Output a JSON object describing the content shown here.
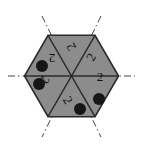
{
  "figure": {
    "canvas": {
      "width": 143,
      "height": 154
    },
    "background_color": "#ffffff"
  },
  "chart_data": {
    "type": "diagram",
    "shape": "regular-hexagon",
    "center": {
      "x": 71.5,
      "y": 76
    },
    "circumradius": 47,
    "orientation": "flat-left-right-vertices",
    "fill_color": "#8c8c8c",
    "stroke_color": "#2b2b2b",
    "sector_count": 6,
    "sectors": [
      {
        "index": 0,
        "name": "right",
        "label": "2",
        "label_rotation_deg": 0,
        "label_x": 100,
        "label_y": 76,
        "has_dot": false
      },
      {
        "index": 1,
        "name": "upper-right",
        "label": "2",
        "label_rotation_deg": 300,
        "label_x": 91,
        "label_y": 57,
        "has_dot": false
      },
      {
        "index": 2,
        "name": "upper-left",
        "label": "2",
        "label_rotation_deg": 240,
        "label_x": 71,
        "label_y": 47,
        "has_dot": false
      },
      {
        "index": 3,
        "name": "left",
        "label": "2",
        "label_rotation_deg": 180,
        "label_x": 52,
        "label_y": 58,
        "has_dot": false
      },
      {
        "index": 4,
        "name": "lower-left",
        "label": "2",
        "label_rotation_deg": 120,
        "label_x": 45,
        "label_y": 80,
        "has_dot": false
      },
      {
        "index": 5,
        "name": "lower-right",
        "label": "2",
        "label_rotation_deg": 60,
        "label_x": 68,
        "label_y": 100,
        "has_dot": false
      }
    ],
    "dots": [
      {
        "index": 0,
        "x": 42,
        "y": 66,
        "r": 6.0,
        "color": "#161616"
      },
      {
        "index": 1,
        "x": 39,
        "y": 84,
        "r": 6.0,
        "color": "#161616"
      },
      {
        "index": 2,
        "x": 80,
        "y": 109,
        "r": 6.0,
        "color": "#161616"
      },
      {
        "index": 3,
        "x": 99,
        "y": 99,
        "r": 6.0,
        "color": "#161616"
      }
    ],
    "symmetry_axes": [
      {
        "index": 0,
        "name": "horizontal-axis",
        "x1": 8,
        "y1": 76,
        "x2": 135,
        "y2": 76
      },
      {
        "index": 1,
        "name": "axis-upper-left-to-lower-right",
        "x1": 42,
        "y1": 16,
        "x2": 101,
        "y2": 137
      },
      {
        "index": 2,
        "name": "axis-upper-right-to-lower-left",
        "x1": 101,
        "y1": 16,
        "x2": 42,
        "y2": 137
      }
    ],
    "axis_style": {
      "stroke_color": "#444444",
      "dash_pattern": "7 3 1.5 3",
      "stroke_width": 1
    },
    "inner_dividers": [
      {
        "index": 0,
        "name": "divider-left-right",
        "from_vertex": 0,
        "to_vertex": 3
      },
      {
        "index": 1,
        "name": "divider-upper-right-lower-left",
        "from_vertex": 1,
        "to_vertex": 4
      },
      {
        "index": 2,
        "name": "divider-upper-left-lower-right",
        "from_vertex": 2,
        "to_vertex": 5
      }
    ],
    "hexagon_vertices": [
      {
        "index": 0,
        "name": "vertex-right",
        "x": 118.5,
        "y": 76.0
      },
      {
        "index": 1,
        "name": "vertex-upper-right",
        "x": 95.0,
        "y": 35.3
      },
      {
        "index": 2,
        "name": "vertex-upper-left",
        "x": 48.0,
        "y": 35.3
      },
      {
        "index": 3,
        "name": "vertex-left",
        "x": 24.5,
        "y": 76.0
      },
      {
        "index": 4,
        "name": "vertex-lower-left",
        "x": 48.0,
        "y": 116.7
      },
      {
        "index": 5,
        "name": "vertex-lower-right",
        "x": 95.0,
        "y": 116.7
      }
    ]
  }
}
